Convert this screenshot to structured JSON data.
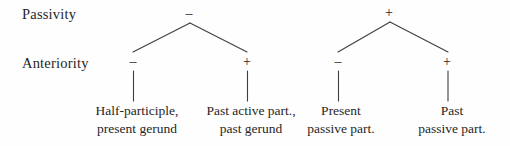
{
  "diagram": {
    "row_labels": {
      "passivity": "Passivity",
      "anteriority": "Anteriority"
    },
    "trees": [
      {
        "name": "passivity-minus-subtree",
        "root_sign": "–",
        "children": [
          {
            "sign": "–",
            "leaf_line1": "Half-participle,",
            "leaf_line2": "present gerund"
          },
          {
            "sign": "+",
            "leaf_line1": "Past active part.,",
            "leaf_line2": "past gerund"
          }
        ]
      },
      {
        "name": "passivity-plus-subtree",
        "root_sign": "+",
        "children": [
          {
            "sign": "–",
            "leaf_line1": "Present",
            "leaf_line2": "passive part."
          },
          {
            "sign": "+",
            "leaf_line1": "Past",
            "leaf_line2": "passive part."
          }
        ]
      }
    ],
    "colors": {
      "background": "#fefefe",
      "text": "#262626",
      "line": "#3f3f3f"
    }
  }
}
